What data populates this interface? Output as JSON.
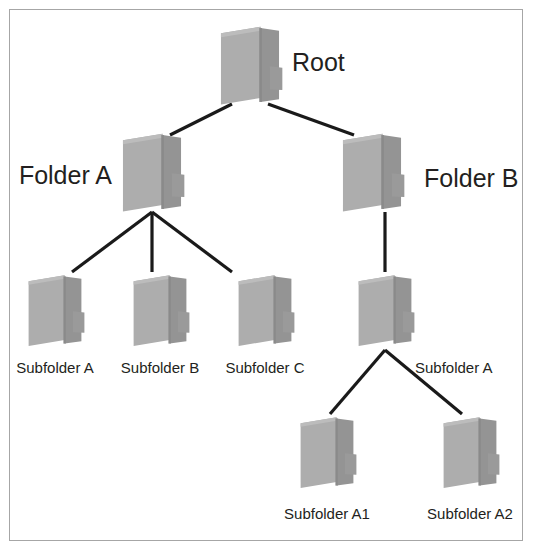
{
  "diagram": {
    "background_color": "#ffffff",
    "border_color": "#a6a6a6",
    "line_color": "#1a1a1a",
    "folder_colors": {
      "back_panel": "#adadad",
      "front_flap": "#949494",
      "tab": "#9a9a9a",
      "edge": "#8a8a8a",
      "highlight": "#bcbcbc"
    }
  },
  "nodes": [
    {
      "id": "root",
      "label": "Root",
      "label_align": "right",
      "font": "lg",
      "x": 250,
      "y": 65,
      "folder_w": 66,
      "folder_h": 82,
      "label_x": 292,
      "label_y": 62
    },
    {
      "id": "folder-a",
      "label": "Folder A",
      "label_align": "left",
      "font": "lg",
      "x": 152,
      "y": 172,
      "folder_w": 66,
      "folder_h": 82,
      "label_x": 112,
      "label_y": 175
    },
    {
      "id": "folder-b",
      "label": "Folder B",
      "label_align": "right",
      "font": "lg",
      "x": 372,
      "y": 172,
      "folder_w": 66,
      "folder_h": 82,
      "label_x": 424,
      "label_y": 178
    },
    {
      "id": "subfolder-a",
      "label": "Subfolder A",
      "label_align": "center",
      "font": "md",
      "x": 55,
      "y": 310,
      "folder_w": 60,
      "folder_h": 76,
      "label_x": 55,
      "label_y": 367
    },
    {
      "id": "subfolder-b",
      "label": "Subfolder B",
      "label_align": "center",
      "font": "md",
      "x": 160,
      "y": 310,
      "folder_w": 60,
      "folder_h": 76,
      "label_x": 160,
      "label_y": 367
    },
    {
      "id": "subfolder-c",
      "label": "Subfolder C",
      "label_align": "center",
      "font": "md",
      "x": 265,
      "y": 310,
      "folder_w": 60,
      "folder_h": 76,
      "label_x": 265,
      "label_y": 367
    },
    {
      "id": "subfolder-a-b",
      "label": "Subfolder A",
      "label_align": "right",
      "font": "md",
      "x": 385,
      "y": 310,
      "folder_w": 60,
      "folder_h": 76,
      "label_x": 415,
      "label_y": 367
    },
    {
      "id": "subfolder-a1",
      "label": "Subfolder A1",
      "label_align": "center",
      "font": "md",
      "x": 327,
      "y": 452,
      "folder_w": 60,
      "folder_h": 76,
      "label_x": 327,
      "label_y": 513
    },
    {
      "id": "subfolder-a2",
      "label": "Subfolder A2",
      "label_align": "center",
      "font": "md",
      "x": 470,
      "y": 452,
      "folder_w": 60,
      "folder_h": 76,
      "label_x": 470,
      "label_y": 513
    }
  ],
  "edges": [
    {
      "id": "root-to-folder-a",
      "from": "root",
      "to": "folder-a",
      "x1": 232,
      "y1": 104,
      "x2": 170,
      "y2": 135
    },
    {
      "id": "root-to-folder-b",
      "from": "root",
      "to": "folder-b",
      "x1": 268,
      "y1": 104,
      "x2": 354,
      "y2": 135
    },
    {
      "id": "folder-a-to-sub-a",
      "from": "folder-a",
      "to": "subfolder-a",
      "x1": 152,
      "y1": 212,
      "x2": 72,
      "y2": 272
    },
    {
      "id": "folder-a-to-sub-b",
      "from": "folder-a",
      "to": "subfolder-b",
      "x1": 152,
      "y1": 212,
      "x2": 152,
      "y2": 272
    },
    {
      "id": "folder-a-to-sub-c",
      "from": "folder-a",
      "to": "subfolder-c",
      "x1": 152,
      "y1": 212,
      "x2": 232,
      "y2": 272
    },
    {
      "id": "folder-b-to-sub-a",
      "from": "folder-b",
      "to": "subfolder-a-b",
      "x1": 385,
      "y1": 212,
      "x2": 385,
      "y2": 272
    },
    {
      "id": "sub-a-to-sub-a1",
      "from": "subfolder-a-b",
      "to": "subfolder-a1",
      "x1": 385,
      "y1": 350,
      "x2": 330,
      "y2": 414
    },
    {
      "id": "sub-a-to-sub-a2",
      "from": "subfolder-a-b",
      "to": "subfolder-a2",
      "x1": 385,
      "y1": 350,
      "x2": 462,
      "y2": 414
    }
  ]
}
